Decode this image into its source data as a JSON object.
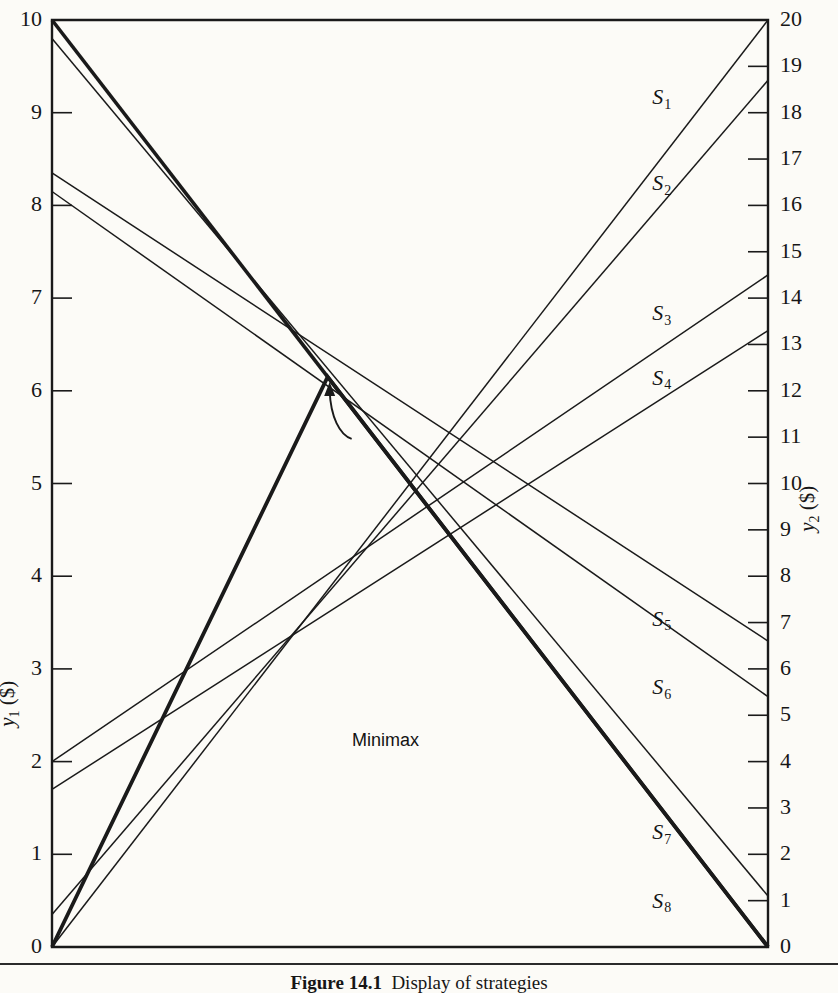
{
  "figure": {
    "caption_number": "Figure 14.1",
    "caption_text": "Display of strategies",
    "background_color": "#fcfbf7",
    "line_color": "#1a1a1a"
  },
  "axes": {
    "left": {
      "title_var": "y",
      "title_sub": "1",
      "title_unit": "($)",
      "min": 0,
      "max": 10,
      "ticks": [
        0,
        1,
        2,
        3,
        4,
        5,
        6,
        7,
        8,
        9,
        10
      ],
      "tick_labels": [
        "0",
        "1",
        "2",
        "3",
        "4",
        "5",
        "6",
        "7",
        "8",
        "9",
        "10"
      ]
    },
    "right": {
      "title_var": "y",
      "title_sub": "2",
      "title_unit": "($)",
      "min": 0,
      "max": 20,
      "ticks": [
        0,
        1,
        2,
        3,
        4,
        5,
        6,
        7,
        8,
        9,
        10,
        11,
        12,
        13,
        14,
        15,
        16,
        17,
        18,
        19,
        20
      ],
      "tick_labels": [
        "0",
        "1",
        "2",
        "3",
        "4",
        "5",
        "6",
        "7",
        "8",
        "9",
        "10",
        "11",
        "12",
        "13",
        "14",
        "15",
        "16",
        "17",
        "18",
        "19",
        "20"
      ]
    }
  },
  "annotation": {
    "minimax_label": "Minimax",
    "minimax_x_fraction": 0.385,
    "minimax_y1_value": 6.15
  },
  "chart_data": {
    "type": "line",
    "title": "Display of strategies",
    "subtitle": "",
    "xlabel": "",
    "ylabel": "y1 ($)",
    "y2label": "y2 ($)",
    "grid": false,
    "legend_position": "inline-right",
    "x": [
      0,
      1
    ],
    "x_note": "Left edge read on y1 scale (0-10); right edge read on y2 scale (0-20)",
    "ylim": [
      0,
      10
    ],
    "y2lim": [
      0,
      20
    ],
    "series": [
      {
        "name": "S1",
        "sub": "1",
        "y1_start": 0.0,
        "y2_end": 20.0,
        "bold": false,
        "label_x_fraction": 0.855,
        "label_y1_value": 9.15
      },
      {
        "name": "S2",
        "sub": "2",
        "y1_start": 0.35,
        "y2_end": 18.7,
        "bold": false,
        "label_x_fraction": 0.855,
        "label_y1_value": 8.22
      },
      {
        "name": "S3",
        "sub": "3",
        "y1_start": 2.0,
        "y2_end": 14.5,
        "bold": false,
        "label_x_fraction": 0.855,
        "label_y1_value": 6.82
      },
      {
        "name": "S4",
        "sub": "4",
        "y1_start": 1.7,
        "y2_end": 13.3,
        "bold": false,
        "label_x_fraction": 0.855,
        "label_y1_value": 6.12
      },
      {
        "name": "S5",
        "sub": "5",
        "y1_start": 8.35,
        "y2_end": 6.6,
        "bold": false,
        "label_x_fraction": 0.855,
        "label_y1_value": 3.52
      },
      {
        "name": "S6",
        "sub": "6",
        "y1_start": 8.15,
        "y2_end": 5.4,
        "bold": false,
        "label_x_fraction": 0.855,
        "label_y1_value": 2.78
      },
      {
        "name": "S7",
        "sub": "7",
        "y1_start": 9.8,
        "y2_end": 1.1,
        "bold": false,
        "label_x_fraction": 0.855,
        "label_y1_value": 1.22
      },
      {
        "name": "S8",
        "sub": "8",
        "y1_start": 10.0,
        "y2_end": 0.0,
        "bold": true,
        "label_x_fraction": 0.855,
        "label_y1_value": 0.48
      }
    ],
    "envelope": {
      "name": "minimax-envelope",
      "bold": true,
      "points": [
        {
          "x_fraction": 0.0,
          "y1_value": 0.0
        },
        {
          "x_fraction": 0.385,
          "y1_value": 6.15
        },
        {
          "x_fraction": 1.0,
          "y1_value": 0.0
        }
      ]
    }
  }
}
